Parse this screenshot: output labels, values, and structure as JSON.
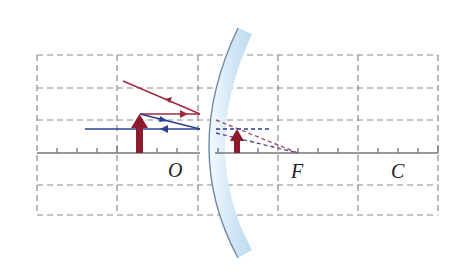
{
  "diagram": {
    "colors": {
      "grid": "#8a8a8a",
      "axis": "#707880",
      "incident_ray": "#a0283c",
      "blue_ray": "#2a3f8f",
      "object": "#8c1c2c",
      "mirror_fill": "#d6eaf6",
      "mirror_edge": "#6d8aa8"
    },
    "labels": {
      "pole": "O",
      "focus": "F",
      "center": "C"
    },
    "elements": {
      "object": "real upright object (arrow) in front of mirror",
      "image": "virtual upright diminished image behind mirror",
      "mirror": "convex mirror"
    }
  }
}
